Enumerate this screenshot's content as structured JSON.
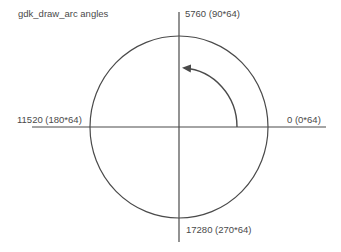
{
  "title": "gdk_draw_arc angles",
  "labels": {
    "top": "5760 (90*64)",
    "left": "11520 (180*64)",
    "right": "0 (0*64)",
    "bottom": "17280 (270*64)"
  },
  "colors": {
    "line": "#4a4a4a",
    "text": "#4a4a4a",
    "background": "#ffffff"
  },
  "geometry": {
    "center": [
      179,
      127
    ],
    "circle_radius": [
      89,
      91
    ],
    "arrow": {
      "from_angle_deg": 0,
      "to_angle_deg": 90,
      "direction": "counter-clockwise"
    }
  }
}
